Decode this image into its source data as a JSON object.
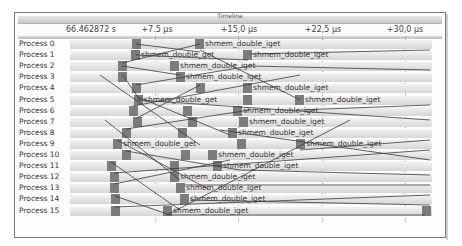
{
  "window": {
    "title": "Timeline"
  },
  "ruler": {
    "labels": [
      {
        "text": "66.462872 s",
        "x": 90
      },
      {
        "text": "+7.5 µs",
        "x": 156
      },
      {
        "text": "+15,0 µs",
        "x": 238
      },
      {
        "text": "+22,5 µs",
        "x": 322
      },
      {
        "text": "+30,0 µs",
        "x": 404
      }
    ]
  },
  "processes": [
    {
      "label": "Process 0"
    },
    {
      "label": "Process 1"
    },
    {
      "label": "Process 2"
    },
    {
      "label": "Process 3"
    },
    {
      "label": "Process 4"
    },
    {
      "label": "Process 5"
    },
    {
      "label": "Process 6"
    },
    {
      "label": "Process 7"
    },
    {
      "label": "Process 8"
    },
    {
      "label": "Process 9"
    },
    {
      "label": "Process 10"
    },
    {
      "label": "Process 11"
    },
    {
      "label": "Process 12"
    },
    {
      "label": "Process 13"
    },
    {
      "label": "Process 14"
    },
    {
      "label": "Process 15"
    }
  ],
  "events": [
    {
      "row": 0,
      "x": 132,
      "label": ""
    },
    {
      "row": 0,
      "x": 195,
      "label": "shmem_double_iget"
    },
    {
      "row": 1,
      "x": 131,
      "label": "shmem_double_get"
    },
    {
      "row": 1,
      "x": 243,
      "label": "shmem_double_iget"
    },
    {
      "row": 2,
      "x": 118,
      "label": ""
    },
    {
      "row": 2,
      "x": 170,
      "label": "shmem_double_iget"
    },
    {
      "row": 3,
      "x": 118,
      "label": ""
    },
    {
      "row": 3,
      "x": 176,
      "label": "shmem_double_iget"
    },
    {
      "row": 4,
      "x": 132,
      "label": ""
    },
    {
      "row": 4,
      "x": 196,
      "label": ""
    },
    {
      "row": 4,
      "x": 243,
      "label": "shmem_double_iget"
    },
    {
      "row": 5,
      "x": 134,
      "label": "shmem_double_get"
    },
    {
      "row": 5,
      "x": 243,
      "label": ""
    },
    {
      "row": 5,
      "x": 295,
      "label": "shmem_double_iget"
    },
    {
      "row": 6,
      "x": 129,
      "label": ""
    },
    {
      "row": 6,
      "x": 183,
      "label": ""
    },
    {
      "row": 6,
      "x": 233,
      "label": "shmem_double_iget"
    },
    {
      "row": 7,
      "x": 133,
      "label": ""
    },
    {
      "row": 7,
      "x": 188,
      "label": ""
    },
    {
      "row": 7,
      "x": 239,
      "label": "shmem_double_iget"
    },
    {
      "row": 8,
      "x": 122,
      "label": ""
    },
    {
      "row": 8,
      "x": 178,
      "label": ""
    },
    {
      "row": 8,
      "x": 228,
      "label": "shmem_double_iget"
    },
    {
      "row": 9,
      "x": 113,
      "label": "shmem_double_get"
    },
    {
      "row": 9,
      "x": 237,
      "label": ""
    },
    {
      "row": 9,
      "x": 296,
      "label": "shmem_double_iget"
    },
    {
      "row": 10,
      "x": 122,
      "label": ""
    },
    {
      "row": 10,
      "x": 181,
      "label": ""
    },
    {
      "row": 10,
      "x": 208,
      "label": "shmem_double_iget"
    },
    {
      "row": 11,
      "x": 107,
      "label": ""
    },
    {
      "row": 11,
      "x": 170,
      "label": ""
    },
    {
      "row": 11,
      "x": 213,
      "label": "shmem_double_iget"
    },
    {
      "row": 12,
      "x": 110,
      "label": ""
    },
    {
      "row": 12,
      "x": 170,
      "label": "shmem_double_iget"
    },
    {
      "row": 13,
      "x": 110,
      "label": ""
    },
    {
      "row": 13,
      "x": 176,
      "label": "shmem_double_iget"
    },
    {
      "row": 14,
      "x": 111,
      "label": ""
    },
    {
      "row": 14,
      "x": 180,
      "label": "shmem_double_iget"
    },
    {
      "row": 15,
      "x": 111,
      "label": ""
    },
    {
      "row": 15,
      "x": 163,
      "label": "shmem_double_iget"
    },
    {
      "row": 15,
      "x": 422,
      "label": ""
    }
  ],
  "messages": [
    [
      136,
      44,
      200,
      52
    ],
    [
      136,
      55,
      248,
      60
    ],
    [
      122,
      63,
      200,
      44
    ],
    [
      122,
      66,
      180,
      75
    ],
    [
      122,
      74,
      140,
      100
    ],
    [
      136,
      85,
      250,
      66
    ],
    [
      200,
      50,
      300,
      100
    ],
    [
      138,
      97,
      230,
      135
    ],
    [
      138,
      100,
      430,
      120
    ],
    [
      133,
      106,
      300,
      75
    ],
    [
      137,
      118,
      200,
      85
    ],
    [
      126,
      129,
      250,
      110
    ],
    [
      117,
      140,
      210,
      190
    ],
    [
      126,
      151,
      240,
      170
    ],
    [
      111,
      162,
      180,
      210
    ],
    [
      114,
      173,
      430,
      150
    ],
    [
      114,
      184,
      230,
      160
    ],
    [
      115,
      196,
      170,
      215
    ],
    [
      115,
      207,
      430,
      195
    ],
    [
      167,
      215,
      350,
      120
    ],
    [
      250,
      54,
      430,
      50
    ],
    [
      250,
      66,
      430,
      70
    ],
    [
      300,
      110,
      430,
      105
    ],
    [
      300,
      150,
      430,
      140
    ],
    [
      220,
      130,
      430,
      160
    ],
    [
      240,
      170,
      430,
      175
    ],
    [
      185,
      185,
      430,
      185
    ],
    [
      190,
      200,
      430,
      205
    ],
    [
      170,
      215,
      425,
      215
    ],
    [
      100,
      75,
      200,
      145
    ],
    [
      105,
      120,
      180,
      180
    ]
  ]
}
